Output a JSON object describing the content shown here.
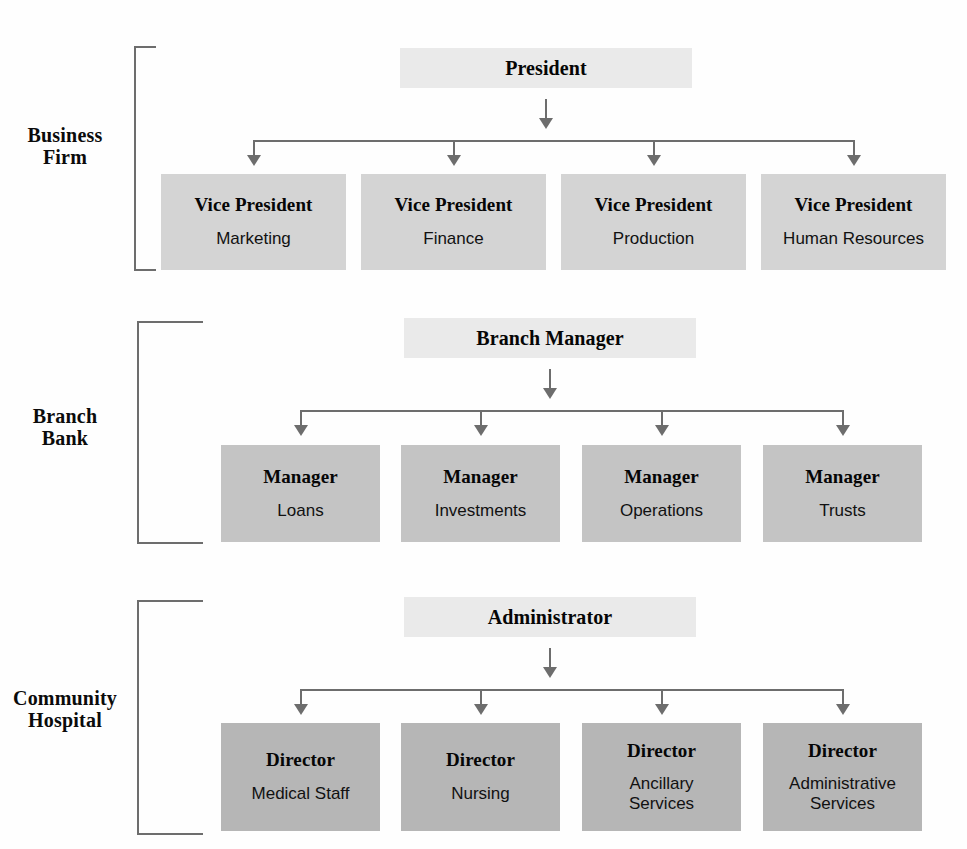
{
  "document": {
    "kind": "organization-charts",
    "chart_count": 3
  },
  "charts": [
    {
      "id": "business-firm",
      "label_lines": [
        "Business",
        "Firm"
      ],
      "head": {
        "title": "President",
        "subtitle": ""
      },
      "children": [
        {
          "title": "Vice President",
          "subtitle": "Marketing"
        },
        {
          "title": "Vice President",
          "subtitle": "Finance"
        },
        {
          "title": "Vice President",
          "subtitle": "Production"
        },
        {
          "title": "Vice President",
          "subtitle": "Human Resources"
        }
      ],
      "box_fill": "#d4d4d4",
      "head_fill": "#eaeaea"
    },
    {
      "id": "branch-bank",
      "label_lines": [
        "Branch",
        "Bank"
      ],
      "head": {
        "title": "Branch Manager",
        "subtitle": ""
      },
      "children": [
        {
          "title": "Manager",
          "subtitle": "Loans"
        },
        {
          "title": "Manager",
          "subtitle": "Investments"
        },
        {
          "title": "Manager",
          "subtitle": "Operations"
        },
        {
          "title": "Manager",
          "subtitle": "Trusts"
        }
      ],
      "box_fill": "#c4c4c4",
      "head_fill": "#eaeaea"
    },
    {
      "id": "community-hospital",
      "label_lines": [
        "Community",
        "Hospital"
      ],
      "head": {
        "title": "Administrator",
        "subtitle": ""
      },
      "children": [
        {
          "title": "Director",
          "subtitle": "Medical Staff",
          "subtitle_line2": ""
        },
        {
          "title": "Director",
          "subtitle": "Nursing",
          "subtitle_line2": ""
        },
        {
          "title": "Director",
          "subtitle": "Ancillary",
          "subtitle_line2": "Services"
        },
        {
          "title": "Director",
          "subtitle": "Administrative",
          "subtitle_line2": "Services"
        }
      ],
      "box_fill": "#b6b6b6",
      "head_fill": "#eaeaea"
    }
  ],
  "connector": {
    "line_color": "#6d6d6d",
    "arrow_glyph": "down-arrow"
  }
}
